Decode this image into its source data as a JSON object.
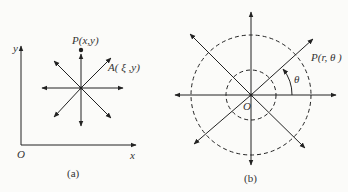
{
  "figure_a": {
    "caption": "(a)",
    "axis_x_label": "x",
    "axis_y_label": "y",
    "origin_label": "O",
    "point_p_label": "P(x,y)",
    "point_a_label": "A( ξ ,y)"
  },
  "figure_b": {
    "caption": "(b)",
    "origin_label": "O",
    "point_p_label": "P(r, θ )",
    "angle_label": "θ"
  },
  "colors": {
    "line": "#222222",
    "background": "#fbfbf9"
  }
}
